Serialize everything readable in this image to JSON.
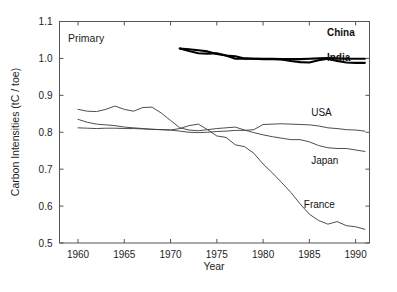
{
  "figure": {
    "panel_label": "Primary",
    "background": "#ffffff",
    "line_color_thin": "#3a3a3a",
    "line_color_bold": "#000000"
  },
  "chart_data": {
    "type": "line",
    "title": "",
    "panel_annotation": "Primary",
    "xlabel": "Year",
    "ylabel": "Carbon Intensities (tC / toe)",
    "xlim": [
      1958,
      1991.5
    ],
    "ylim": [
      0.5,
      1.1
    ],
    "xticks": [
      1960,
      1965,
      1970,
      1975,
      1980,
      1985,
      1990
    ],
    "xtick_labels": [
      "1960",
      "1965",
      "1970",
      "1975",
      "1980",
      "1985",
      "1990"
    ],
    "yticks": [
      0.5,
      0.6,
      0.7,
      0.8,
      0.9,
      1.0,
      1.1
    ],
    "ytick_labels": [
      "0.5",
      "0.6",
      "0.7",
      "0.8",
      "0.9",
      "1.0",
      "1.1"
    ],
    "grid": false,
    "legend_position": "inline-right-labels",
    "series": [
      {
        "name": "China",
        "label": "China",
        "style": "bold",
        "label_bold": true,
        "x": [
          1971,
          1972,
          1973,
          1974,
          1975,
          1976,
          1977,
          1978,
          1979,
          1980,
          1981,
          1982,
          1983,
          1984,
          1985,
          1986,
          1987,
          1988,
          1989,
          1990,
          1991
        ],
        "values": [
          1.027,
          1.025,
          1.022,
          1.019,
          1.012,
          1.008,
          1.006,
          1.0,
          0.999,
          0.999,
          0.999,
          0.998,
          0.998,
          0.998,
          0.999,
          1.0,
          1.001,
          1.0,
          0.999,
          0.999,
          0.999
        ]
      },
      {
        "name": "India",
        "label": "India",
        "style": "bold",
        "label_bold": true,
        "x": [
          1971,
          1972,
          1973,
          1974,
          1975,
          1976,
          1977,
          1978,
          1979,
          1980,
          1981,
          1982,
          1983,
          1984,
          1985,
          1986,
          1987,
          1988,
          1989,
          1990,
          1991
        ],
        "values": [
          1.027,
          1.02,
          1.014,
          1.013,
          1.014,
          1.008,
          0.999,
          0.999,
          0.999,
          0.998,
          0.998,
          0.997,
          0.993,
          0.99,
          0.989,
          0.995,
          0.999,
          0.993,
          0.989,
          0.988,
          0.988
        ]
      },
      {
        "name": "USA",
        "label": "USA",
        "style": "thin",
        "label_bold": false,
        "x": [
          1960,
          1961,
          1962,
          1963,
          1964,
          1965,
          1966,
          1967,
          1968,
          1969,
          1970,
          1971,
          1972,
          1973,
          1974,
          1975,
          1976,
          1977,
          1978,
          1979,
          1980,
          1981,
          1982,
          1983,
          1984,
          1985,
          1986,
          1987,
          1988,
          1989,
          1990,
          1991
        ],
        "values": [
          0.812,
          0.811,
          0.81,
          0.811,
          0.811,
          0.81,
          0.81,
          0.809,
          0.808,
          0.807,
          0.806,
          0.803,
          0.8,
          0.799,
          0.8,
          0.802,
          0.803,
          0.805,
          0.805,
          0.807,
          0.821,
          0.822,
          0.823,
          0.822,
          0.821,
          0.82,
          0.817,
          0.812,
          0.81,
          0.807,
          0.806,
          0.803
        ]
      },
      {
        "name": "Japan",
        "label": "Japan",
        "style": "thin",
        "label_bold": false,
        "x": [
          1960,
          1961,
          1962,
          1963,
          1964,
          1965,
          1966,
          1967,
          1968,
          1969,
          1970,
          1971,
          1972,
          1973,
          1974,
          1975,
          1976,
          1977,
          1978,
          1979,
          1980,
          1981,
          1982,
          1983,
          1984,
          1985,
          1986,
          1987,
          1988,
          1989,
          1990,
          1991
        ],
        "values": [
          0.862,
          0.857,
          0.856,
          0.862,
          0.871,
          0.862,
          0.857,
          0.867,
          0.868,
          0.852,
          0.832,
          0.812,
          0.806,
          0.804,
          0.807,
          0.81,
          0.812,
          0.814,
          0.806,
          0.799,
          0.793,
          0.788,
          0.784,
          0.78,
          0.78,
          0.774,
          0.764,
          0.758,
          0.756,
          0.756,
          0.752,
          0.748
        ]
      },
      {
        "name": "France",
        "label": "France",
        "style": "thin",
        "label_bold": false,
        "x": [
          1960,
          1961,
          1962,
          1963,
          1964,
          1965,
          1966,
          1967,
          1968,
          1969,
          1970,
          1971,
          1972,
          1973,
          1974,
          1975,
          1976,
          1977,
          1978,
          1979,
          1980,
          1981,
          1982,
          1983,
          1984,
          1985,
          1986,
          1987,
          1988,
          1989,
          1990,
          1991
        ],
        "values": [
          0.835,
          0.827,
          0.822,
          0.82,
          0.818,
          0.814,
          0.812,
          0.81,
          0.808,
          0.807,
          0.806,
          0.81,
          0.818,
          0.822,
          0.807,
          0.79,
          0.786,
          0.766,
          0.761,
          0.743,
          0.714,
          0.69,
          0.664,
          0.637,
          0.606,
          0.578,
          0.561,
          0.551,
          0.558,
          0.547,
          0.544,
          0.537
        ]
      }
    ],
    "series_labels": [
      {
        "text": "China",
        "x": 1986.9,
        "y": 1.061,
        "bold": true
      },
      {
        "text": "India",
        "x": 1986.9,
        "y": 0.992,
        "bold": true
      },
      {
        "text": "USA",
        "x": 1985.2,
        "y": 0.843,
        "bold": false
      },
      {
        "text": "Japan",
        "x": 1985.2,
        "y": 0.714,
        "bold": false
      },
      {
        "text": "France",
        "x": 1984.4,
        "y": 0.594,
        "bold": false
      }
    ]
  }
}
